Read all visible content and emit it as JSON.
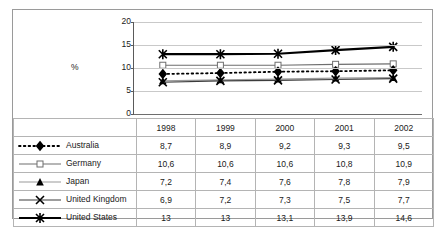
{
  "chart_data": {
    "type": "line",
    "title": "",
    "xlabel": "",
    "ylabel": "%",
    "categories": [
      "1998",
      "1999",
      "2000",
      "2001",
      "2002"
    ],
    "ylim": [
      0,
      20
    ],
    "yticks": [
      0,
      5,
      10,
      15,
      20
    ],
    "ytick_labels": [
      "0",
      "5",
      "10",
      "15",
      "20"
    ],
    "grid": true,
    "legend_position": "bottom-table",
    "series": [
      {
        "name": "Australia",
        "marker": "filled-diamond",
        "line_style": "dotted",
        "color": "#000000",
        "values": [
          8.7,
          8.9,
          9.2,
          9.3,
          9.5
        ],
        "labels": [
          "8,7",
          "8,9",
          "9,2",
          "9,3",
          "9,5"
        ]
      },
      {
        "name": "Germany",
        "marker": "hollow-square",
        "line_style": "solid",
        "color": "#6e6e6e",
        "values": [
          10.6,
          10.6,
          10.6,
          10.8,
          10.9
        ],
        "labels": [
          "10,6",
          "10,6",
          "10,6",
          "10,8",
          "10,9"
        ]
      },
      {
        "name": "Japan",
        "marker": "filled-triangle",
        "line_style": "solid",
        "color": "#9a9a9a",
        "values": [
          7.2,
          7.4,
          7.6,
          7.8,
          7.9
        ],
        "labels": [
          "7,2",
          "7,4",
          "7,6",
          "7,8",
          "7,9"
        ]
      },
      {
        "name": "United Kingdom",
        "marker": "x-cross",
        "line_style": "solid",
        "color": "#3c3c3c",
        "values": [
          6.9,
          7.2,
          7.3,
          7.5,
          7.7
        ],
        "labels": [
          "6,9",
          "7,2",
          "7,3",
          "7,5",
          "7,7"
        ]
      },
      {
        "name": "United States",
        "marker": "asterisk",
        "line_style": "solid-thick",
        "color": "#000000",
        "values": [
          13,
          13,
          13.1,
          13.9,
          14.6
        ],
        "labels": [
          "13",
          "13",
          "13,1",
          "13,9",
          "14,6"
        ]
      }
    ]
  },
  "axis": {
    "y_unit_label": "%"
  }
}
